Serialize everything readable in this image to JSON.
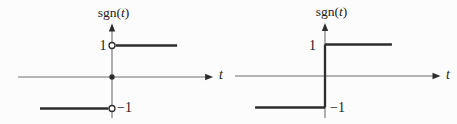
{
  "figure": {
    "background": "#fcfcfc",
    "ink": "#2d2d2d",
    "axis_color": "#6e6e6e",
    "caption": ""
  },
  "chart_data": [
    {
      "type": "line",
      "title": "sgn(t)",
      "title_parts": [
        "sgn(",
        "t",
        ")"
      ],
      "xlabel": "t",
      "ylabel": "",
      "xlim": [
        -3.13,
        3.37
      ],
      "ylim": [
        -1.3,
        1.7
      ],
      "grid": false,
      "legend": "none",
      "yticks": [
        {
          "value": 1,
          "label": "1"
        },
        {
          "value": -1,
          "label": "−1"
        }
      ],
      "description": "signum function: y = -1 for t < 0, y = 1 for t > 0, open circles at (0, 1) and (0, -1), filled dot at (0, 0)",
      "series": [
        {
          "name": "sgn(t), t < 0",
          "x": [
            -2.4,
            -0.12
          ],
          "y": [
            -1,
            -1
          ]
        },
        {
          "name": "sgn(t), t > 0",
          "x": [
            0.12,
            2.17
          ],
          "y": [
            1,
            1
          ]
        }
      ],
      "points": [
        {
          "x": 0,
          "y": 1,
          "style": "open"
        },
        {
          "x": 0,
          "y": 0,
          "style": "filled"
        },
        {
          "x": 0,
          "y": -1,
          "style": "open"
        }
      ]
    },
    {
      "type": "line",
      "title": "sgn(t)",
      "title_parts": [
        "sgn(",
        "t",
        ")"
      ],
      "xlabel": "t",
      "ylabel": "",
      "xlim": [
        -3.0,
        3.85
      ],
      "ylim": [
        -1.33,
        1.68
      ],
      "grid": false,
      "legend": "none",
      "yticks": [
        {
          "value": 1,
          "label": "1"
        },
        {
          "value": -1,
          "label": "−1"
        }
      ],
      "description": "signum drawn as continuous step: y = -1 for t < 0, vertical jump segment at t = 0, y = 1 for t > 0",
      "series": [
        {
          "name": "sgn(t), t < 0",
          "x": [
            -2.33,
            0
          ],
          "y": [
            -1,
            -1
          ]
        },
        {
          "name": "jump at t = 0",
          "x": [
            0,
            0
          ],
          "y": [
            -1,
            1
          ]
        },
        {
          "name": "sgn(t), t > 0",
          "x": [
            0,
            2.23
          ],
          "y": [
            1,
            1
          ]
        }
      ],
      "points": []
    }
  ]
}
